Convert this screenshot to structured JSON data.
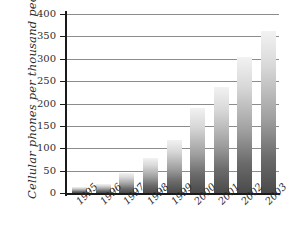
{
  "chart_data": {
    "type": "bar",
    "title": "",
    "xlabel": "",
    "ylabel": "Cellular phones per thousand people",
    "categories": [
      "1995",
      "1996",
      "1997",
      "1998",
      "1999",
      "2000",
      "2001",
      "2002",
      "2003"
    ],
    "values": [
      13,
      21,
      45,
      78,
      118,
      190,
      238,
      303,
      362
    ],
    "ylim": [
      0,
      400
    ],
    "ytick_labels": [
      "400",
      "350",
      "300",
      "250",
      "200",
      "150",
      "100",
      "50",
      "0"
    ],
    "ytick_values": [
      400,
      350,
      300,
      250,
      200,
      150,
      100,
      50,
      0
    ],
    "grid": true,
    "legend": "none",
    "series": [
      {
        "name": "Cellular phones per thousand people",
        "values": [
          13,
          21,
          45,
          78,
          118,
          190,
          238,
          303,
          362
        ]
      }
    ],
    "colors": {
      "bar_top": "#f2f2f2",
      "bar_bottom": "#4a4a4a",
      "axis": "#1a1a1a",
      "gridline": "#8c8c8c",
      "background": "#ffffff",
      "text": "#2b2b2b"
    }
  }
}
